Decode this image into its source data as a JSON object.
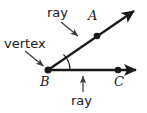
{
  "figure": {
    "background_color": "#ffffff",
    "stroke_color": "#1a1a1a",
    "width": 147,
    "height": 113
  },
  "labels": {
    "ray_top": "ray",
    "ray_bottom": "ray",
    "vertex": "vertex",
    "point_a": "A",
    "point_b": "B",
    "point_c": "C"
  },
  "geometry": {
    "vertex_point": {
      "name": "B",
      "x": 48,
      "y": 70
    },
    "ray_ba": {
      "name": "ray-BA",
      "from_x": 48,
      "from_y": 70,
      "to_x": 138,
      "to_y": 8,
      "marked_point": {
        "name": "A",
        "x": 97,
        "y": 36
      },
      "arrowhead": "end"
    },
    "ray_bc": {
      "name": "ray-BC",
      "from_x": 48,
      "from_y": 70,
      "to_x": 141,
      "to_y": 70,
      "marked_point": {
        "name": "C",
        "x": 118,
        "y": 70
      },
      "arrowhead": "end"
    },
    "angle_arc": {
      "center_x": 48,
      "center_y": 70,
      "radius": 22
    },
    "pointers": [
      {
        "name": "pointer-ray-top",
        "from_x": 62,
        "from_y": 23,
        "to_x": 80,
        "to_y": 38
      },
      {
        "name": "pointer-vertex",
        "from_x": 26,
        "from_y": 52,
        "to_x": 45,
        "to_y": 67
      },
      {
        "name": "pointer-ray-bottom",
        "from_x": 83,
        "from_y": 92,
        "to_x": 83,
        "to_y": 74
      }
    ]
  }
}
